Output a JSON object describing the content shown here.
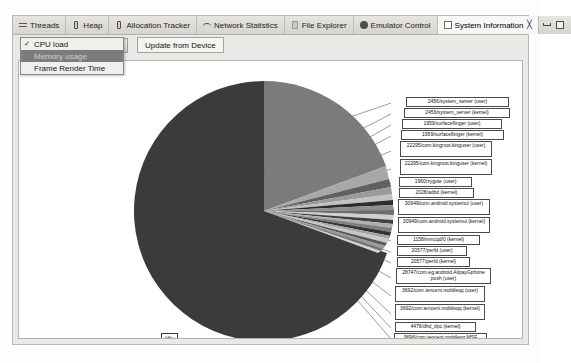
{
  "window": {
    "tabs": [
      {
        "label": "Threads",
        "icon": "threads-icon",
        "active": false
      },
      {
        "label": "Heap",
        "icon": "heap-icon",
        "active": false
      },
      {
        "label": "Allocation Tracker",
        "icon": "allocation-tracker-icon",
        "active": false
      },
      {
        "label": "Network Statistics",
        "icon": "network-statistics-icon",
        "active": false
      },
      {
        "label": "File Explorer",
        "icon": "file-explorer-icon",
        "active": false
      },
      {
        "label": "Emulator Control",
        "icon": "emulator-control-icon",
        "active": false
      },
      {
        "label": "System Information",
        "icon": "system-information-icon",
        "active": true
      }
    ],
    "close_glyph": "╳",
    "minimize_icon": "minimize-icon",
    "maximize_icon": "maximize-icon"
  },
  "toolbar": {
    "selected_view": "CPU load",
    "update_label": "Update from Device",
    "dropdown_icon": "chevron-down-icon"
  },
  "menu": {
    "items": [
      {
        "label": "CPU load",
        "checked": true,
        "selected": false
      },
      {
        "label": "Memory usage",
        "checked": false,
        "selected": true
      },
      {
        "label": "Frame Render Time",
        "checked": false,
        "selected": false
      }
    ]
  },
  "chart_data": {
    "type": "pie",
    "title": "",
    "legend": "none",
    "idle_label": "Idle",
    "colors": {
      "idle": "#3b3b3b",
      "major": "#7b7b7b",
      "slivers": [
        "#a8a8a8",
        "#555555",
        "#8f8f8f",
        "#bdbdbd",
        "#2f2f2f",
        "#9c9c9c",
        "#6a6a6a",
        "#cfcfcf",
        "#464646",
        "#b4b4b4",
        "#7f7f7f",
        "#383838",
        "#a0a0a0",
        "#c6c6c6",
        "#5e5e5e",
        "#949494",
        "#717171",
        "#d4d4d4",
        "#4c4c4c",
        "#ababab"
      ],
      "label_bg": "#ffffff",
      "label_border": "#4a4a4a"
    },
    "slices": [
      {
        "label": "Idle",
        "value": 72.0
      },
      {
        "label": "2456/system_server (user)",
        "value": 11.5
      },
      {
        "label": "2456/system_server (kernel)",
        "value": 2.6
      },
      {
        "label": "1959/surfaceflinger (user)",
        "value": 1.5
      },
      {
        "label": "1959/surfaceflinger (kernel)",
        "value": 1.3
      },
      {
        "label": "22295/com.kingroot.kinguser (user)",
        "value": 1.2
      },
      {
        "label": "22295/com.kingroot.kinguser (kernel)",
        "value": 1.1
      },
      {
        "label": "1960/zygote (user)",
        "value": 0.9
      },
      {
        "label": "2028/adbd (kernel)",
        "value": 0.85
      },
      {
        "label": "30949/com.android.systemui (user)",
        "value": 0.8
      },
      {
        "label": "30949/com.android.systemui (kernel)",
        "value": 0.75
      },
      {
        "label": "1158/mmcqd/0 (kernel)",
        "value": 0.7
      },
      {
        "label": "20577/perfd (user)",
        "value": 0.65
      },
      {
        "label": "20577/perfd (kernel)",
        "value": 0.6
      },
      {
        "label": "28747/com.eg.android.AlipayGphone push (user)",
        "value": 0.55
      },
      {
        "label": "3692/com.tencent.mobileqq (user)",
        "value": 0.5
      },
      {
        "label": "3692/com.tencent.mobileqq (kernel)",
        "value": 0.45
      },
      {
        "label": "4476/dhd_dpc (kernel)",
        "value": 0.4
      },
      {
        "label": "9696/com.tencent.mobileqq:MSF (user)",
        "value": 0.35
      },
      {
        "label": "9696/com.tencent.mobileqq:MSF (kernel)",
        "value": 0.3
      },
      {
        "label": "21890/kworker/0:4 (kernel)",
        "value": 0.25
      },
      {
        "label": "27588/com.sohu.inputmethod.sogou (user)",
        "value": 0.2
      }
    ],
    "callouts": [
      {
        "text": "2456/system_server (user)",
        "x": 392,
        "y": 82,
        "w": 103,
        "h": 9,
        "multiline": false
      },
      {
        "text": "2456/system_server (kernel)",
        "x": 390,
        "y": 93,
        "w": 106,
        "h": 9,
        "multiline": false
      },
      {
        "text": "1959/surfaceflinger (user)",
        "x": 388,
        "y": 104,
        "w": 100,
        "h": 9,
        "multiline": false
      },
      {
        "text": "1959/surfaceflinger (kernel)",
        "x": 387,
        "y": 115,
        "w": 103,
        "h": 9,
        "multiline": false
      },
      {
        "text": "22295/com.kingroot.kinguser (user)",
        "x": 386,
        "y": 126,
        "w": 92,
        "h": 16,
        "multiline": true
      },
      {
        "text": "22295/com.kingroot.kinguser (kernel)",
        "x": 386,
        "y": 144,
        "w": 92,
        "h": 16,
        "multiline": true
      },
      {
        "text": "1960/zygote (user)",
        "x": 385,
        "y": 162,
        "w": 73,
        "h": 9,
        "multiline": false
      },
      {
        "text": "2028/adbd (kernel)",
        "x": 385,
        "y": 173,
        "w": 75,
        "h": 9,
        "multiline": false
      },
      {
        "text": "30949/com.android.systemui (user)",
        "x": 384,
        "y": 184,
        "w": 92,
        "h": 16,
        "multiline": true
      },
      {
        "text": "30949/com.android.systemui (kernel)",
        "x": 384,
        "y": 202,
        "w": 92,
        "h": 16,
        "multiline": true
      },
      {
        "text": "1158/mmcqd/0 (kernel)",
        "x": 383,
        "y": 220,
        "w": 83,
        "h": 9,
        "multiline": false
      },
      {
        "text": "20577/perfd (user)",
        "x": 383,
        "y": 231,
        "w": 70,
        "h": 9,
        "multiline": false
      },
      {
        "text": "20577/perfd (kernel)",
        "x": 383,
        "y": 242,
        "w": 73,
        "h": 9,
        "multiline": false
      },
      {
        "text": "28747/com.eg.android.AlipayGphone push (user)",
        "x": 382,
        "y": 253,
        "w": 95,
        "h": 16,
        "multiline": true
      },
      {
        "text": "3692/com.tencent.mobileqq (user)",
        "x": 381,
        "y": 271,
        "w": 90,
        "h": 16,
        "multiline": true
      },
      {
        "text": "3692/com.tencent.mobileqq (kernel)",
        "x": 381,
        "y": 289,
        "w": 90,
        "h": 16,
        "multiline": true
      },
      {
        "text": "4476/dhd_dpc (kernel)",
        "x": 381,
        "y": 307,
        "w": 81,
        "h": 9,
        "multiline": false
      },
      {
        "text": "9696/com.tencent.mobileqq:MSF (user)",
        "x": 380,
        "y": 318,
        "w": 93,
        "h": 16,
        "multiline": true
      },
      {
        "text": "9696/com.tencent.mobileqq:MSF (kernel)",
        "x": 380,
        "y": 336,
        "w": 93,
        "h": 16,
        "multiline": true
      },
      {
        "text": "21890/kworker/0:4 (kernel)",
        "x": 379,
        "y": 354,
        "w": 88,
        "h": 9,
        "multiline": false
      },
      {
        "text": "27588/com.sohu.inputmethod.sogou (user)",
        "x": 389,
        "y": 365,
        "w": 93,
        "h": 16,
        "multiline": true
      }
    ]
  }
}
